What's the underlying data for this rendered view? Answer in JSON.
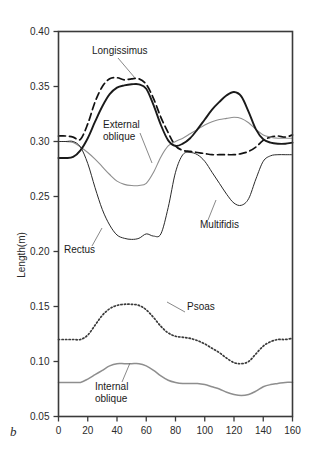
{
  "panel": {
    "label": "b"
  },
  "chart_data": {
    "type": "line",
    "title": "",
    "xlabel": "",
    "ylabel": "Length(m)",
    "xlim": [
      0,
      160
    ],
    "ylim": [
      0.05,
      0.4
    ],
    "xticks": [
      0,
      20,
      40,
      60,
      80,
      100,
      120,
      140,
      160
    ],
    "xtick_labels": [
      "0",
      "20",
      "40",
      "60",
      "80",
      "100",
      "120",
      "140",
      "160"
    ],
    "yticks": [
      0.05,
      0.1,
      0.15,
      0.2,
      0.25,
      0.3,
      0.35,
      0.4
    ],
    "ytick_labels": [
      "0.05",
      "0.10",
      "0.15",
      "0.20",
      "0.25",
      "0.30",
      "0.35",
      "0.40"
    ],
    "grid": false,
    "legend": "inline-annotations",
    "x": [
      0,
      5,
      10,
      15,
      20,
      25,
      30,
      35,
      40,
      45,
      50,
      55,
      60,
      65,
      70,
      75,
      80,
      85,
      90,
      95,
      100,
      105,
      110,
      115,
      120,
      125,
      130,
      135,
      140,
      145,
      150,
      155,
      160
    ],
    "series": [
      {
        "name": "Longissimus",
        "style": "dashed",
        "color": "#111111",
        "values": [
          0.305,
          0.305,
          0.304,
          0.302,
          0.316,
          0.336,
          0.35,
          0.357,
          0.358,
          0.356,
          0.357,
          0.357,
          0.352,
          0.339,
          0.322,
          0.308,
          0.296,
          0.292,
          0.291,
          0.29,
          0.289,
          0.288,
          0.288,
          0.288,
          0.288,
          0.289,
          0.291,
          0.295,
          0.301,
          0.304,
          0.305,
          0.304,
          0.306
        ],
        "label_text": "Longissimus",
        "label_x": 92,
        "label_y": 54
      },
      {
        "name": "External oblique",
        "style": "solid-thin-gray",
        "color": "#8e8e8e",
        "values": [
          0.3,
          0.3,
          0.299,
          0.295,
          0.29,
          0.284,
          0.277,
          0.27,
          0.264,
          0.261,
          0.26,
          0.26,
          0.262,
          0.272,
          0.286,
          0.296,
          0.3,
          0.303,
          0.307,
          0.311,
          0.315,
          0.318,
          0.32,
          0.321,
          0.322,
          0.321,
          0.317,
          0.311,
          0.306,
          0.304,
          0.303,
          0.303,
          0.303
        ],
        "label_text": "External\noblique",
        "label_x": 103,
        "label_y": 128
      },
      {
        "name": "Rectus",
        "style": "solid-thick",
        "color": "#1a1a1a",
        "values": [
          0.285,
          0.285,
          0.286,
          0.292,
          0.303,
          0.318,
          0.332,
          0.343,
          0.349,
          0.351,
          0.352,
          0.352,
          0.348,
          0.333,
          0.315,
          0.301,
          0.296,
          0.298,
          0.303,
          0.311,
          0.32,
          0.329,
          0.336,
          0.342,
          0.345,
          0.341,
          0.327,
          0.311,
          0.302,
          0.299,
          0.298,
          0.298,
          0.299
        ],
        "label_text": "Rectus",
        "label_x": 64,
        "label_y": 253
      },
      {
        "name": "Multifidis",
        "style": "solid-thin",
        "color": "#2a2a2a",
        "values": [
          0.3,
          0.3,
          0.3,
          0.295,
          0.28,
          0.258,
          0.238,
          0.224,
          0.215,
          0.212,
          0.211,
          0.212,
          0.216,
          0.214,
          0.216,
          0.24,
          0.272,
          0.288,
          0.29,
          0.288,
          0.282,
          0.272,
          0.262,
          0.252,
          0.244,
          0.242,
          0.248,
          0.266,
          0.282,
          0.287,
          0.288,
          0.288,
          0.288
        ],
        "label_text": "Multifidis",
        "label_x": 200,
        "label_y": 228
      },
      {
        "name": "Psoas",
        "style": "dotted",
        "color": "#3a3a3a",
        "values": [
          0.12,
          0.12,
          0.12,
          0.12,
          0.124,
          0.133,
          0.142,
          0.148,
          0.151,
          0.152,
          0.152,
          0.151,
          0.147,
          0.14,
          0.132,
          0.126,
          0.123,
          0.122,
          0.121,
          0.119,
          0.116,
          0.112,
          0.108,
          0.103,
          0.099,
          0.098,
          0.1,
          0.107,
          0.114,
          0.118,
          0.12,
          0.12,
          0.121
        ],
        "label_text": "Psoas",
        "label_x": 187,
        "label_y": 310
      },
      {
        "name": "Internal oblique",
        "style": "solid-gray",
        "color": "#8e8e8e",
        "values": [
          0.081,
          0.081,
          0.081,
          0.081,
          0.084,
          0.088,
          0.092,
          0.096,
          0.098,
          0.098,
          0.098,
          0.098,
          0.096,
          0.092,
          0.087,
          0.083,
          0.081,
          0.08,
          0.08,
          0.08,
          0.079,
          0.077,
          0.075,
          0.072,
          0.07,
          0.069,
          0.07,
          0.073,
          0.077,
          0.079,
          0.08,
          0.081,
          0.081
        ],
        "label_text": "Internal\noblique",
        "label_x": 95,
        "label_y": 390
      }
    ]
  }
}
